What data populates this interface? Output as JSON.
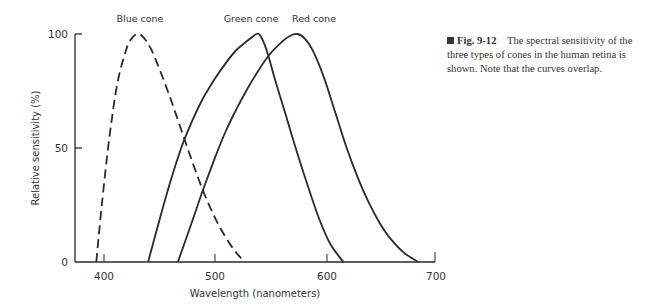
{
  "chart_data": {
    "type": "line",
    "title": "",
    "xlabel": "Wavelength (nanometers)",
    "ylabel": "Relative sensitivity (%)",
    "xlim": [
      375,
      700
    ],
    "ylim": [
      0,
      100
    ],
    "x_ticks": [
      400,
      500,
      600,
      700
    ],
    "y_ticks": [
      0,
      50,
      100
    ],
    "grid": false,
    "legend": "inline labels above curve peaks",
    "series": [
      {
        "name": "Blue cone",
        "style": "dashed",
        "peak_nm": 430,
        "x": [
          393,
          398,
          405,
          412,
          420,
          425,
          430,
          435,
          442,
          450,
          460,
          470,
          480,
          490,
          500,
          510,
          520,
          528
        ],
        "y": [
          0,
          25,
          55,
          78,
          93,
          98,
          100,
          99,
          94,
          85,
          72,
          58,
          44,
          31,
          20,
          11,
          4,
          0
        ]
      },
      {
        "name": "Green cone",
        "style": "solid",
        "peak_nm": 540,
        "x": [
          440,
          450,
          460,
          470,
          480,
          490,
          500,
          510,
          520,
          530,
          538,
          542,
          548,
          555,
          565,
          575,
          585,
          595,
          605,
          617
        ],
        "y": [
          0,
          18,
          35,
          50,
          62,
          72,
          80,
          87,
          93,
          97,
          100,
          99,
          92,
          80,
          64,
          48,
          33,
          19,
          8,
          0
        ]
      },
      {
        "name": "Red cone",
        "style": "solid",
        "peak_nm": 575,
        "x": [
          467,
          480,
          490,
          500,
          510,
          520,
          530,
          540,
          550,
          560,
          568,
          575,
          582,
          590,
          600,
          610,
          620,
          630,
          640,
          650,
          660,
          672,
          685
        ],
        "y": [
          0,
          18,
          32,
          45,
          57,
          67,
          76,
          84,
          91,
          96,
          99,
          100,
          98,
          92,
          80,
          65,
          50,
          37,
          26,
          17,
          10,
          4,
          0
        ]
      }
    ],
    "annotations": [
      "Blue cone",
      "Green cone",
      "Red cone"
    ]
  },
  "axes": {
    "xlabel": "Wavelength (nanometers)",
    "ylabel": "Relative sensitivity (%)",
    "x_ticks": [
      "400",
      "500",
      "600",
      "700"
    ],
    "y_ticks": [
      "0",
      "50",
      "100"
    ]
  },
  "labels": {
    "blue": "Blue cone",
    "green": "Green cone",
    "red": "Red cone"
  },
  "caption": {
    "fig_num": "Fig. 9-12",
    "text": "The spectral sensitivity of the three types of cones in the human retina is shown. Note that the curves overlap."
  },
  "colors": {
    "line": "#2a2a2a",
    "text": "#333333"
  }
}
